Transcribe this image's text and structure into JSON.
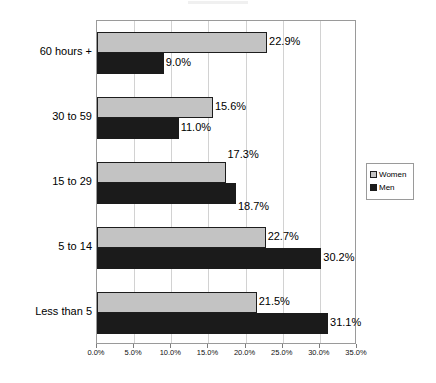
{
  "chart_data": {
    "type": "bar",
    "orientation": "horizontal",
    "title": "",
    "subtitle": "",
    "xlabel": "",
    "ylabel": "",
    "categories": [
      "60 hours +",
      "30 to 59",
      "15 to 29",
      "5 to 14",
      "Less than 5"
    ],
    "series": [
      {
        "name": "Women",
        "color": "#c3c3c3",
        "values": [
          22.9,
          15.6,
          17.3,
          22.7,
          21.5
        ]
      },
      {
        "name": "Men",
        "color": "#1b1b1b",
        "values": [
          9.0,
          11.0,
          18.7,
          30.2,
          31.1
        ]
      }
    ],
    "data_labels": [
      [
        "22.9%",
        "15.6%",
        "17.3%",
        "22.7%",
        "21.5%"
      ],
      [
        "9.0%",
        "11.0%",
        "18.7%",
        "30.2%",
        "31.1%"
      ]
    ],
    "xlim": [
      0,
      35
    ],
    "xticks": [
      0,
      5,
      10,
      15,
      20,
      25,
      30,
      35
    ],
    "xtick_labels": [
      "0.0%",
      "5.0%",
      "10.0%",
      "15.0%",
      "20.0%",
      "25.0%",
      "30.0%",
      "35.0%"
    ],
    "grid": {
      "vertical": true,
      "horizontal": false
    },
    "legend": {
      "position": "right",
      "entries": [
        "Women",
        "Men"
      ]
    }
  }
}
